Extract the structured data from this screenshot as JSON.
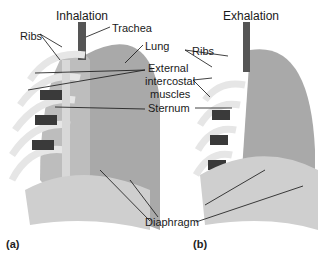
{
  "figure": {
    "panel_a": {
      "tag": "(a)",
      "title": "Inhalation",
      "labels": {
        "ribs": "Ribs",
        "trachea": "Trachea",
        "lung": "Lung",
        "external_intercostal_1": "External",
        "external_intercostal_2": "intercostal",
        "external_intercostal_3": "muscles",
        "sternum": "Sternum"
      }
    },
    "panel_b": {
      "tag": "(b)",
      "title": "Exhalation",
      "labels": {
        "ribs": "Ribs"
      }
    },
    "shared_labels": {
      "diaphragm": "Diaphragm"
    }
  }
}
